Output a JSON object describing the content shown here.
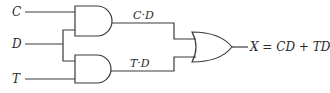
{
  "diagram": {
    "type": "logic-circuit",
    "inputs": [
      {
        "id": "C",
        "label": "C"
      },
      {
        "id": "D",
        "label": "D"
      },
      {
        "id": "T",
        "label": "T"
      }
    ],
    "gates": [
      {
        "id": "and1",
        "type": "AND",
        "inputs": [
          "C",
          "D"
        ],
        "output_label": "C·D"
      },
      {
        "id": "and2",
        "type": "AND",
        "inputs": [
          "D",
          "T"
        ],
        "output_label": "T·D"
      },
      {
        "id": "or1",
        "type": "OR",
        "inputs": [
          "and1",
          "and2"
        ],
        "output_label": "X = CD + TD"
      }
    ],
    "colors": {
      "stroke": "#3a3a3a",
      "text": "#2a2a2a",
      "background": "#ffffff"
    }
  }
}
